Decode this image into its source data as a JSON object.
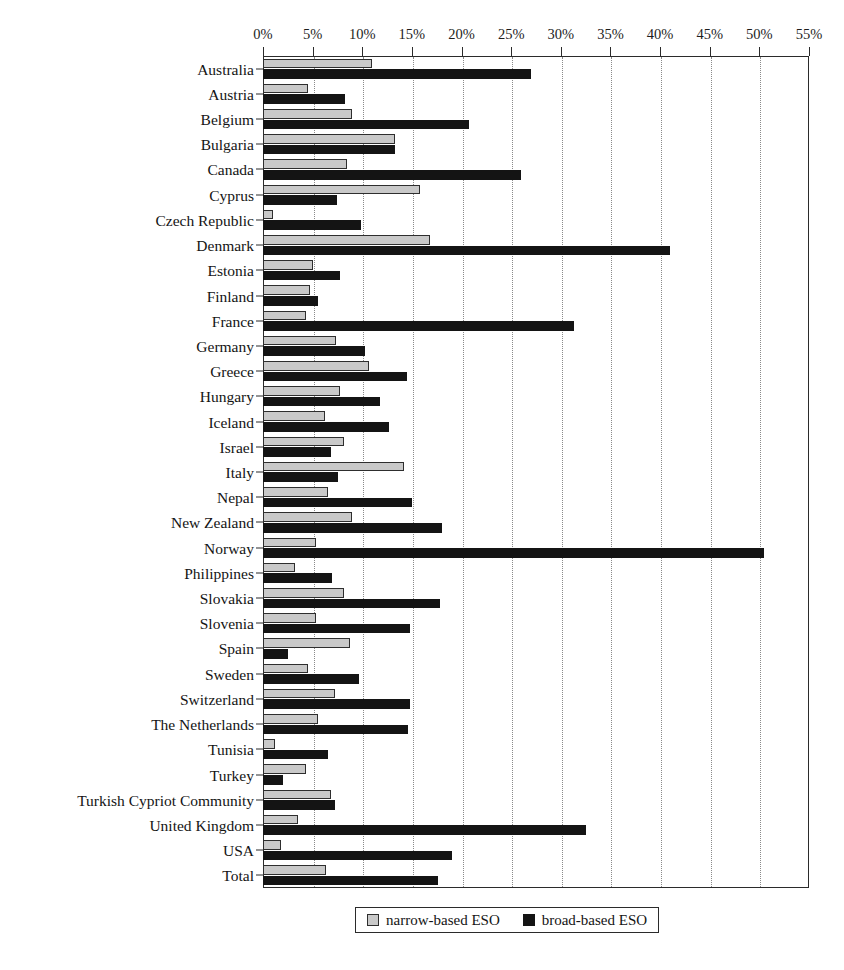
{
  "chart_data": {
    "type": "bar",
    "orientation": "horizontal",
    "title": "",
    "xlabel": "",
    "ylabel": "",
    "xlim": [
      0,
      55
    ],
    "xticks": [
      "0%",
      "5%",
      "10%",
      "15%",
      "20%",
      "25%",
      "30%",
      "35%",
      "40%",
      "45%",
      "50%",
      "55%"
    ],
    "xtick_values": [
      0,
      5,
      10,
      15,
      20,
      25,
      30,
      35,
      40,
      45,
      50,
      55
    ],
    "grid": "vertical-dotted",
    "legend_position": "bottom-center",
    "legend": [
      "narrow-based ESO",
      "broad-based ESO"
    ],
    "categories": [
      "Australia",
      "Austria",
      "Belgium",
      "Bulgaria",
      "Canada",
      "Cyprus",
      "Czech Republic",
      "Denmark",
      "Estonia",
      "Finland",
      "France",
      "Germany",
      "Greece",
      "Hungary",
      "Iceland",
      "Israel",
      "Italy",
      "Nepal",
      "New Zealand",
      "Norway",
      "Philippines",
      "Slovakia",
      "Slovenia",
      "Spain",
      "Sweden",
      "Switzerland",
      "The Netherlands",
      "Tunisia",
      "Turkey",
      "Turkish Cypriot Community",
      "United Kingdom",
      "USA",
      "Total"
    ],
    "series": [
      {
        "name": "narrow-based ESO",
        "color": "#c9c9c9",
        "values": [
          11.0,
          4.5,
          9.0,
          13.3,
          8.5,
          15.8,
          1.0,
          16.8,
          5.0,
          4.7,
          4.3,
          7.4,
          10.7,
          7.8,
          6.2,
          8.2,
          14.2,
          6.5,
          9.0,
          5.3,
          3.2,
          8.2,
          5.3,
          8.8,
          4.5,
          7.3,
          5.5,
          1.2,
          4.3,
          6.8,
          3.5,
          1.8,
          6.3
        ]
      },
      {
        "name": "broad-based ESO",
        "color": "#141414",
        "values": [
          27.0,
          8.3,
          20.8,
          13.3,
          26.0,
          7.5,
          9.9,
          41.0,
          7.8,
          5.5,
          31.3,
          10.3,
          14.5,
          11.8,
          12.7,
          6.9,
          7.6,
          15.0,
          18.0,
          50.5,
          7.0,
          17.8,
          14.8,
          2.5,
          9.7,
          14.8,
          14.6,
          6.5,
          2.0,
          7.3,
          32.5,
          19.0,
          17.6
        ]
      }
    ]
  }
}
